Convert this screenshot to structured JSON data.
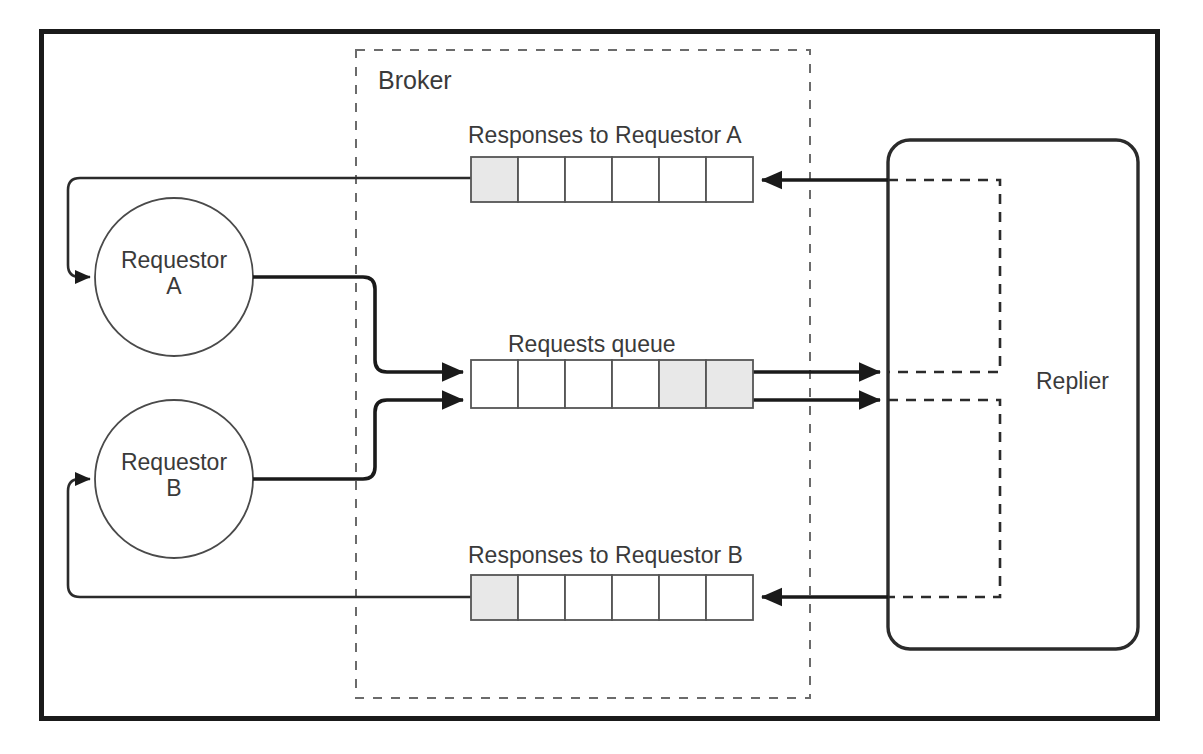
{
  "diagram": {
    "type": "architecture-diagram",
    "colors": {
      "frame": "#1a1a1a",
      "stroke": "#2b2b2b",
      "light_stroke": "#555555",
      "dashed": "#6b6b6b",
      "cell_fill_empty": "#ffffff",
      "cell_fill_occupied": "#e8e8e8",
      "text": "#3a3a3a",
      "background": "#ffffff"
    },
    "broker": {
      "label": "Broker"
    },
    "replier": {
      "label": "Replier"
    },
    "requestors": [
      {
        "id": "a",
        "line1": "Requestor",
        "line2": "A"
      },
      {
        "id": "b",
        "line1": "Requestor",
        "line2": "B"
      }
    ],
    "queues": [
      {
        "id": "responses-a",
        "label": "Responses to Requestor A",
        "cell_count": 6,
        "occupied_cells": [
          0
        ],
        "direction": "right-to-left"
      },
      {
        "id": "requests",
        "label": "Requests queue",
        "cell_count": 6,
        "occupied_cells": [
          4,
          5
        ],
        "direction": "left-to-right"
      },
      {
        "id": "responses-b",
        "label": "Responses to Requestor B",
        "cell_count": 6,
        "occupied_cells": [
          0
        ],
        "direction": "right-to-left"
      }
    ],
    "flows": [
      {
        "id": "a-to-requests",
        "from": "Requestor A",
        "to": "Requests queue"
      },
      {
        "id": "b-to-requests",
        "from": "Requestor B",
        "to": "Requests queue"
      },
      {
        "id": "requests-to-replier-1",
        "from": "Requests queue",
        "to": "Replier"
      },
      {
        "id": "requests-to-replier-2",
        "from": "Requests queue",
        "to": "Replier"
      },
      {
        "id": "replier-to-responses-a",
        "from": "Replier",
        "to": "Responses to Requestor A"
      },
      {
        "id": "replier-to-responses-b",
        "from": "Replier",
        "to": "Responses to Requestor B"
      },
      {
        "id": "responses-a-to-a",
        "from": "Responses to Requestor A",
        "to": "Requestor A"
      },
      {
        "id": "responses-b-to-b",
        "from": "Responses to Requestor B",
        "to": "Requestor B"
      }
    ]
  }
}
